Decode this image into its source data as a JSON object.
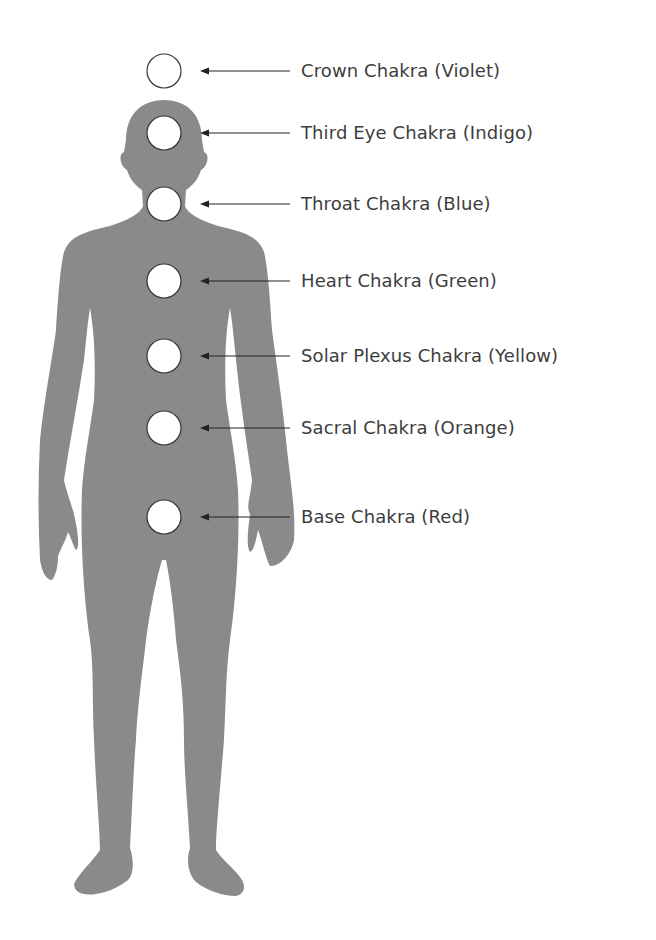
{
  "diagram": {
    "figure_color": "#8a8a8a",
    "circle_fill": "#ffffff",
    "circle_stroke": "#333333",
    "arrow_color": "#222222",
    "text_color": "#3d3d3d",
    "chakras": [
      {
        "label": "Crown Chakra (Violet)",
        "y": 71
      },
      {
        "label": "Third Eye Chakra (Indigo)",
        "y": 133
      },
      {
        "label": "Throat Chakra (Blue)",
        "y": 204
      },
      {
        "label": "Heart Chakra (Green)",
        "y": 281
      },
      {
        "label": "Solar Plexus Chakra (Yellow)",
        "y": 356
      },
      {
        "label": "Sacral Chakra (Orange)",
        "y": 428
      },
      {
        "label": "Base Chakra (Red)",
        "y": 517
      }
    ]
  }
}
